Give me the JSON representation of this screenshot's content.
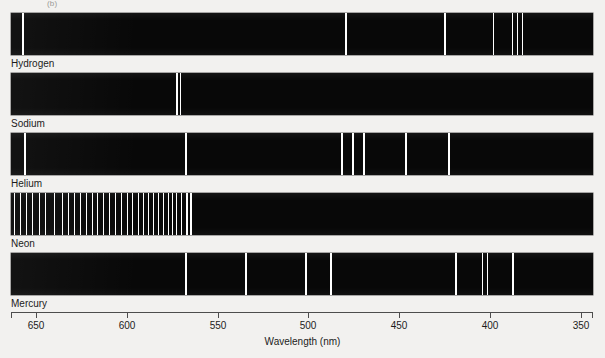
{
  "figure": {
    "panel_tag": "(b)",
    "axis": {
      "title": "Wavelength (nm)",
      "unit": "nm",
      "ticks": [
        650,
        600,
        550,
        500,
        450,
        400,
        350
      ],
      "range_left_nm": 663,
      "range_right_nm": 344,
      "direction": "decreasing-left-to-right"
    }
  },
  "chart_data": {
    "type": "line",
    "xlabel": "Wavelength (nm)",
    "ylabel": "",
    "xlim": [
      663,
      344
    ],
    "x_ticks": [
      650,
      600,
      550,
      500,
      450,
      400,
      350
    ],
    "grid": false,
    "legend": "none",
    "note": "Bright-line (emission) spectra. Each row is one element; each vertical white line is an emission line at the stated wavelength. Band spans 663 nm (left) to 344 nm (right).",
    "series": [
      {
        "name": "Hydrogen",
        "lines_nm": [
          656,
          486,
          434,
          410,
          397,
          389,
          384
        ]
      },
      {
        "name": "Sodium",
        "lines_nm": [
          590,
          589
        ]
      },
      {
        "name": "Helium",
        "lines_nm": [
          656,
          588,
          502,
          492,
          471,
          447,
          403
        ]
      },
      {
        "name": "Neon",
        "lines_nm": [
          660,
          657,
          653,
          650,
          646,
          643,
          638,
          633,
          630,
          626,
          622,
          618,
          614,
          610,
          607,
          603,
          600,
          597,
          594,
          591,
          588,
          585,
          583,
          580,
          576,
          574,
          570,
          567,
          565,
          561,
          558,
          555,
          551,
          548,
          544,
          540
        ]
      },
      {
        "name": "Mercury",
        "lines_nm": [
          576,
          546,
          502,
          491,
          436,
          419,
          415,
          408,
          385
        ]
      }
    ]
  },
  "spectra": [
    {
      "label": "Hydrogen",
      "lines": [
        {
          "left_px": 22,
          "width_px": 1.6
        },
        {
          "left_px": 345,
          "width_px": 1.6
        },
        {
          "left_px": 444,
          "width_px": 1.6
        },
        {
          "left_px": 493,
          "width_px": 1.3
        },
        {
          "left_px": 512,
          "width_px": 1.2
        },
        {
          "left_px": 517,
          "width_px": 1.2
        },
        {
          "left_px": 522,
          "width_px": 1.2
        }
      ]
    },
    {
      "label": "Sodium",
      "lines": [
        {
          "left_px": 176,
          "width_px": 1.6
        },
        {
          "left_px": 179.5,
          "width_px": 1.6
        }
      ]
    },
    {
      "label": "Helium",
      "lines": [
        {
          "left_px": 24,
          "width_px": 1.6
        },
        {
          "left_px": 185,
          "width_px": 1.6
        },
        {
          "left_px": 341,
          "width_px": 1.6
        },
        {
          "left_px": 352,
          "width_px": 1.6
        },
        {
          "left_px": 363,
          "width_px": 1.6
        },
        {
          "left_px": 405,
          "width_px": 1.6
        },
        {
          "left_px": 448,
          "width_px": 1.6
        }
      ]
    },
    {
      "label": "Neon",
      "lines": [
        {
          "left_px": 14,
          "width_px": 1.3
        },
        {
          "left_px": 20,
          "width_px": 1.3
        },
        {
          "left_px": 26,
          "width_px": 1.3
        },
        {
          "left_px": 32,
          "width_px": 1.3
        },
        {
          "left_px": 39,
          "width_px": 1.3
        },
        {
          "left_px": 45,
          "width_px": 1.3
        },
        {
          "left_px": 54,
          "width_px": 1.3
        },
        {
          "left_px": 62,
          "width_px": 1.3
        },
        {
          "left_px": 68,
          "width_px": 1.3
        },
        {
          "left_px": 74,
          "width_px": 1.3
        },
        {
          "left_px": 80,
          "width_px": 1.3
        },
        {
          "left_px": 86,
          "width_px": 1.3
        },
        {
          "left_px": 92,
          "width_px": 1.3
        },
        {
          "left_px": 97,
          "width_px": 1.3
        },
        {
          "left_px": 103,
          "width_px": 1.3
        },
        {
          "left_px": 109,
          "width_px": 1.3
        },
        {
          "left_px": 115,
          "width_px": 1.3
        },
        {
          "left_px": 121,
          "width_px": 1.3
        },
        {
          "left_px": 127,
          "width_px": 1.3
        },
        {
          "left_px": 132,
          "width_px": 1.3
        },
        {
          "left_px": 138,
          "width_px": 1.3
        },
        {
          "left_px": 143,
          "width_px": 1.3
        },
        {
          "left_px": 148,
          "width_px": 1.3
        },
        {
          "left_px": 153,
          "width_px": 1.3
        },
        {
          "left_px": 158,
          "width_px": 1.3
        },
        {
          "left_px": 163,
          "width_px": 1.3
        },
        {
          "left_px": 168,
          "width_px": 1.3
        },
        {
          "left_px": 172,
          "width_px": 1.3
        },
        {
          "left_px": 176,
          "width_px": 1.3
        },
        {
          "left_px": 181,
          "width_px": 1.3
        },
        {
          "left_px": 186,
          "width_px": 1.6
        },
        {
          "left_px": 190,
          "width_px": 1.6
        }
      ]
    },
    {
      "label": "Mercury",
      "lines": [
        {
          "left_px": 185,
          "width_px": 1.8
        },
        {
          "left_px": 245,
          "width_px": 1.6
        },
        {
          "left_px": 305,
          "width_px": 1.6
        },
        {
          "left_px": 330,
          "width_px": 1.6
        },
        {
          "left_px": 455,
          "width_px": 1.6
        },
        {
          "left_px": 482,
          "width_px": 1.2
        },
        {
          "left_px": 487,
          "width_px": 1.2
        },
        {
          "left_px": 512,
          "width_px": 1.6
        }
      ]
    }
  ],
  "axis_ticks": [
    {
      "label": "650",
      "left_px": 36
    },
    {
      "label": "600",
      "left_px": 127
    },
    {
      "label": "550",
      "left_px": 218
    },
    {
      "label": "500",
      "left_px": 308
    },
    {
      "label": "450",
      "left_px": 399
    },
    {
      "label": "400",
      "left_px": 490
    },
    {
      "label": "350",
      "left_px": 581
    }
  ],
  "axis_end_ticks": [
    {
      "left_px": 11
    },
    {
      "left_px": 592
    }
  ]
}
